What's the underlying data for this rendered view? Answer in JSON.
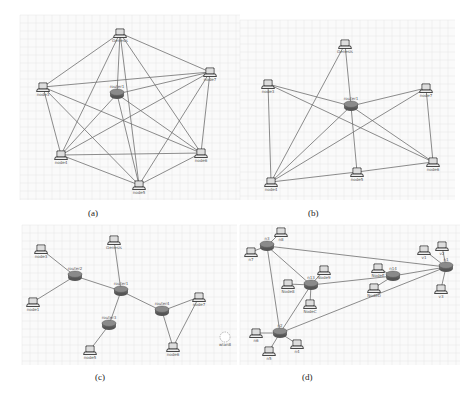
{
  "figure": {
    "panels": [
      {
        "id": "a",
        "caption": "(a)",
        "frame": {
          "x": 20,
          "y": 15,
          "w": 220,
          "h": 185
        },
        "caption_pos": {
          "x": 88,
          "y": 208
        },
        "nodes": [
          {
            "id": "Genesis",
            "label": "Genesis",
            "type": "laptop",
            "x": 120,
            "y": 33
          },
          {
            "id": "node7",
            "label": "node7",
            "type": "laptop",
            "x": 210,
            "y": 72
          },
          {
            "id": "node3",
            "label": "node3",
            "type": "laptop",
            "x": 43,
            "y": 87
          },
          {
            "id": "router1",
            "label": "router1",
            "type": "router",
            "x": 117,
            "y": 94
          },
          {
            "id": "node6",
            "label": "node6",
            "type": "laptop",
            "x": 201,
            "y": 153
          },
          {
            "id": "node4",
            "label": "node4",
            "type": "laptop",
            "x": 61,
            "y": 155
          },
          {
            "id": "node5",
            "label": "node5",
            "type": "laptop",
            "x": 139,
            "y": 185
          }
        ],
        "links": [
          [
            "Genesis",
            "node7"
          ],
          [
            "Genesis",
            "node3"
          ],
          [
            "Genesis",
            "node6"
          ],
          [
            "Genesis",
            "node4"
          ],
          [
            "Genesis",
            "node5"
          ],
          [
            "Genesis",
            "router1"
          ],
          [
            "node7",
            "node3"
          ],
          [
            "node7",
            "node6"
          ],
          [
            "node7",
            "node4"
          ],
          [
            "node7",
            "node5"
          ],
          [
            "node7",
            "router1"
          ],
          [
            "node3",
            "node6"
          ],
          [
            "node3",
            "node4"
          ],
          [
            "node3",
            "node5"
          ],
          [
            "node6",
            "node4"
          ],
          [
            "node6",
            "node5"
          ],
          [
            "node6",
            "router1"
          ],
          [
            "node4",
            "node5"
          ],
          [
            "node4",
            "router1"
          ],
          [
            "node5",
            "router1"
          ]
        ]
      },
      {
        "id": "b",
        "caption": "(b)",
        "frame": {
          "x": 240,
          "y": 20,
          "w": 215,
          "h": 180
        },
        "caption_pos": {
          "x": 308,
          "y": 208
        },
        "nodes": [
          {
            "id": "Genesis",
            "label": "Genesis",
            "type": "laptop",
            "x": 345,
            "y": 44
          },
          {
            "id": "node3",
            "label": "node3",
            "type": "laptop",
            "x": 268,
            "y": 84
          },
          {
            "id": "node7",
            "label": "node7",
            "type": "laptop",
            "x": 426,
            "y": 88
          },
          {
            "id": "router1",
            "label": "router1",
            "type": "router",
            "x": 351,
            "y": 106
          },
          {
            "id": "node6",
            "label": "node6",
            "type": "laptop",
            "x": 433,
            "y": 162
          },
          {
            "id": "node5",
            "label": "node5",
            "type": "laptop",
            "x": 357,
            "y": 172
          },
          {
            "id": "node4",
            "label": "node4",
            "type": "laptop",
            "x": 271,
            "y": 182
          }
        ],
        "links": [
          [
            "Genesis",
            "node4"
          ],
          [
            "Genesis",
            "router1"
          ],
          [
            "node3",
            "router1"
          ],
          [
            "node3",
            "node6"
          ],
          [
            "node3",
            "node4"
          ],
          [
            "node7",
            "router1"
          ],
          [
            "node7",
            "node4"
          ],
          [
            "node7",
            "node6"
          ],
          [
            "router1",
            "node4"
          ],
          [
            "router1",
            "node5"
          ],
          [
            "router1",
            "node6"
          ],
          [
            "node5",
            "node4"
          ],
          [
            "node5",
            "node6"
          ]
        ]
      },
      {
        "id": "c",
        "caption": "(c)",
        "frame": {
          "x": 22,
          "y": 225,
          "w": 215,
          "h": 140
        },
        "caption_pos": {
          "x": 95,
          "y": 372
        },
        "nodes": [
          {
            "id": "Genesis",
            "label": "Genesis",
            "type": "laptop",
            "x": 114,
            "y": 240
          },
          {
            "id": "node3",
            "label": "node3",
            "type": "laptop",
            "x": 41,
            "y": 249
          },
          {
            "id": "router2",
            "label": "router2",
            "type": "router",
            "x": 75,
            "y": 276
          },
          {
            "id": "router1",
            "label": "router1",
            "type": "router",
            "x": 121,
            "y": 291
          },
          {
            "id": "node1",
            "label": "node1",
            "type": "laptop",
            "x": 33,
            "y": 302
          },
          {
            "id": "node7",
            "label": "node7",
            "type": "laptop",
            "x": 199,
            "y": 297
          },
          {
            "id": "router4",
            "label": "router4",
            "type": "router",
            "x": 162,
            "y": 311
          },
          {
            "id": "router3",
            "label": "router3",
            "type": "router",
            "x": 109,
            "y": 325
          },
          {
            "id": "node6",
            "label": "node6",
            "type": "laptop",
            "x": 173,
            "y": 347
          },
          {
            "id": "node5",
            "label": "node5",
            "type": "laptop",
            "x": 90,
            "y": 350
          },
          {
            "id": "wlan8",
            "label": "wlan8",
            "type": "cloud",
            "x": 225,
            "y": 337
          }
        ],
        "links": [
          [
            "node3",
            "router2"
          ],
          [
            "node1",
            "router2"
          ],
          [
            "router2",
            "router1"
          ],
          [
            "Genesis",
            "router1"
          ],
          [
            "router1",
            "router4"
          ],
          [
            "router1",
            "router3"
          ],
          [
            "router3",
            "node5"
          ],
          [
            "router4",
            "node7"
          ],
          [
            "router4",
            "node6"
          ],
          [
            "node7",
            "node6"
          ]
        ]
      },
      {
        "id": "d",
        "caption": "(d)",
        "frame": {
          "x": 240,
          "y": 225,
          "w": 220,
          "h": 140
        },
        "caption_pos": {
          "x": 302,
          "y": 372
        },
        "nodes": [
          {
            "id": "n3",
            "label": "n3",
            "type": "router",
            "x": 267,
            "y": 246
          },
          {
            "id": "n8",
            "label": "n8",
            "type": "laptop",
            "x": 281,
            "y": 232
          },
          {
            "id": "n7",
            "label": "n7",
            "type": "laptop",
            "x": 251,
            "y": 252
          },
          {
            "id": "n13",
            "label": "n13",
            "type": "router",
            "x": 311,
            "y": 285
          },
          {
            "id": "Node9",
            "label": "Node9",
            "type": "laptop",
            "x": 324,
            "y": 270
          },
          {
            "id": "Node8",
            "label": "Node8",
            "type": "laptop",
            "x": 288,
            "y": 284
          },
          {
            "id": "NodeC",
            "label": "NodeC",
            "type": "laptop",
            "x": 310,
            "y": 304
          },
          {
            "id": "n14",
            "label": "n14",
            "type": "router",
            "x": 393,
            "y": 276
          },
          {
            "id": "NodeE",
            "label": "NodeE",
            "type": "laptop",
            "x": 378,
            "y": 268
          },
          {
            "id": "NodeD",
            "label": "NodeD",
            "type": "laptop",
            "x": 374,
            "y": 288
          },
          {
            "id": "n1",
            "label": "n1",
            "type": "router",
            "x": 446,
            "y": 267
          },
          {
            "id": "v1",
            "label": "v1",
            "type": "laptop",
            "x": 424,
            "y": 250
          },
          {
            "id": "v2",
            "label": "v2",
            "type": "laptop",
            "x": 442,
            "y": 246
          },
          {
            "id": "v3",
            "label": "v3",
            "type": "laptop",
            "x": 441,
            "y": 289
          },
          {
            "id": "n2",
            "label": "n2",
            "type": "router",
            "x": 280,
            "y": 333
          },
          {
            "id": "n6",
            "label": "n6",
            "type": "laptop",
            "x": 256,
            "y": 333
          },
          {
            "id": "n5",
            "label": "n5",
            "type": "laptop",
            "x": 269,
            "y": 351
          },
          {
            "id": "n4",
            "label": "n4",
            "type": "laptop",
            "x": 297,
            "y": 344
          }
        ],
        "links": [
          [
            "n3",
            "n8"
          ],
          [
            "n3",
            "n7"
          ],
          [
            "n3",
            "n1"
          ],
          [
            "n3",
            "n13"
          ],
          [
            "n3",
            "n2"
          ],
          [
            "n13",
            "Node9"
          ],
          [
            "n13",
            "Node8"
          ],
          [
            "n13",
            "NodeC"
          ],
          [
            "n13",
            "n14"
          ],
          [
            "n13",
            "n2"
          ],
          [
            "n14",
            "NodeE"
          ],
          [
            "n14",
            "NodeD"
          ],
          [
            "n14",
            "n1"
          ],
          [
            "n1",
            "v1"
          ],
          [
            "n1",
            "v2"
          ],
          [
            "n1",
            "v3"
          ],
          [
            "n1",
            "n2"
          ],
          [
            "n2",
            "n6"
          ],
          [
            "n2",
            "n5"
          ],
          [
            "n2",
            "n4"
          ]
        ]
      }
    ]
  }
}
